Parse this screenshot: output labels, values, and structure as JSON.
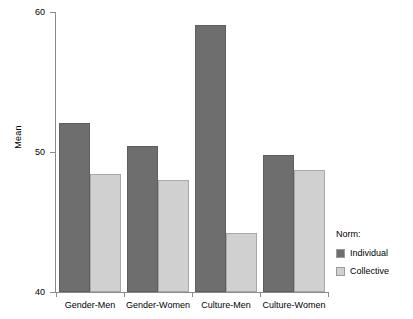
{
  "chart_data": {
    "type": "bar",
    "title": "",
    "xlabel": "",
    "ylabel": "Mean",
    "ylim": [
      40,
      60
    ],
    "yticks": [
      40,
      50,
      60
    ],
    "ytick_labels": [
      "40",
      "50",
      "60"
    ],
    "grid": false,
    "legend_position": "right",
    "legend_title": "Norm:",
    "categories": [
      "Gender-Men",
      "Gender-Women",
      "Culture-Men",
      "Culture-Women"
    ],
    "series": [
      {
        "name": "Individual",
        "color": "#6e6e6e",
        "values": [
          52.1,
          50.4,
          59.1,
          49.8
        ]
      },
      {
        "name": "Collective",
        "color": "#d0d0d0",
        "values": [
          48.4,
          48.0,
          44.2,
          48.7
        ]
      }
    ]
  },
  "axes": {
    "y_title": "Mean",
    "y_tick_labels": [
      "60",
      "50",
      "40"
    ],
    "x_tick_labels": [
      "Gender-Men",
      "Gender-Women",
      "Culture-Men",
      "Culture-Women"
    ]
  },
  "legend": {
    "title": "Norm:",
    "items": [
      {
        "label": "Individual",
        "swatch": "series-individual"
      },
      {
        "label": "Collective",
        "swatch": "series-collective"
      }
    ]
  }
}
